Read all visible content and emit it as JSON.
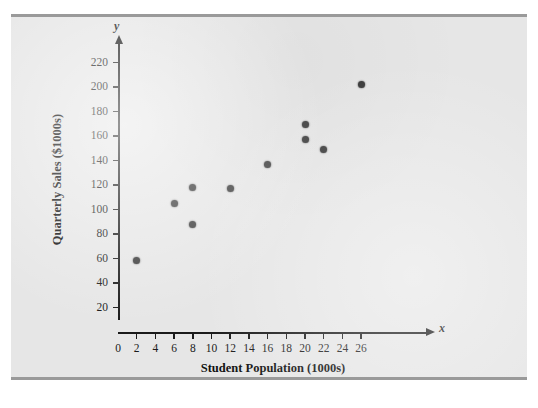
{
  "figure": {
    "caption": "CHART 1 SCATTER DIAGRAM FOR ARMAND'S PIZZA PARLORS",
    "panel_bg": "#e6e6e6",
    "rule_color": "#9a9a9a",
    "point_color": "#3a3a3a",
    "axis_color": "#1a1a1a"
  },
  "chart_data": {
    "type": "scatter",
    "title": "",
    "xlabel": "Student Population (1000s)",
    "ylabel": "Quarterly Sales ($1000s)",
    "x_var_symbol": "x",
    "y_var_symbol": "y",
    "xlim": [
      0,
      27.5
    ],
    "ylim": [
      0,
      235
    ],
    "xticks": [
      0,
      2,
      4,
      6,
      8,
      10,
      12,
      14,
      16,
      18,
      20,
      22,
      24,
      26
    ],
    "yticks": [
      20,
      40,
      60,
      80,
      100,
      120,
      140,
      160,
      180,
      200,
      220
    ],
    "grid": false,
    "legend": null,
    "points": [
      {
        "x": 2,
        "y": 58
      },
      {
        "x": 6,
        "y": 105
      },
      {
        "x": 8,
        "y": 88
      },
      {
        "x": 8,
        "y": 118
      },
      {
        "x": 12,
        "y": 117
      },
      {
        "x": 16,
        "y": 137
      },
      {
        "x": 20,
        "y": 157
      },
      {
        "x": 20,
        "y": 169
      },
      {
        "x": 22,
        "y": 149
      },
      {
        "x": 26,
        "y": 202
      }
    ]
  }
}
